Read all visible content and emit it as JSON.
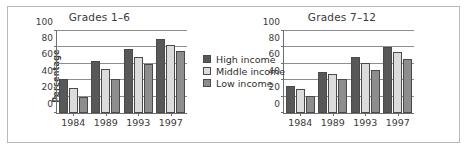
{
  "chart_data": [
    {
      "type": "bar",
      "title": "Grades 1–6",
      "xlabel": "",
      "ylabel": "Percentage",
      "categories": [
        "1984",
        "1989",
        "1993",
        "1997"
      ],
      "ylim": [
        0,
        100
      ],
      "yticks": [
        0,
        20,
        40,
        60,
        80,
        100
      ],
      "grid": true,
      "legend_position": "center-right",
      "series": [
        {
          "name": "High income",
          "values": [
            42,
            64,
            78,
            90
          ]
        },
        {
          "name": "Middle income",
          "values": [
            30,
            54,
            68,
            83
          ]
        },
        {
          "name": "Low income",
          "values": [
            19,
            41,
            60,
            76
          ]
        }
      ]
    },
    {
      "type": "bar",
      "title": "Grades 7–12",
      "xlabel": "",
      "ylabel": "",
      "categories": [
        "1984",
        "1989",
        "1993",
        "1997"
      ],
      "ylim": [
        0,
        100
      ],
      "yticks": [
        0,
        20,
        40,
        60,
        80,
        100
      ],
      "grid": true,
      "legend_position": "none",
      "series": [
        {
          "name": "High income",
          "values": [
            33,
            50,
            68,
            80
          ]
        },
        {
          "name": "Middle income",
          "values": [
            29,
            47,
            61,
            75
          ]
        },
        {
          "name": "Low income",
          "values": [
            21,
            42,
            53,
            66
          ]
        }
      ]
    }
  ],
  "legend": {
    "items": [
      {
        "label": "High income"
      },
      {
        "label": "Middle income"
      },
      {
        "label": "Low income"
      }
    ]
  },
  "colors": {
    "high_income": "#585858",
    "middle_income": "#dcdcdc",
    "low_income": "#8d8d8d",
    "axis": "#6f6f6f",
    "gridline": "#8e8e8e",
    "text": "#3a3a3a",
    "border": "#b9b9b9",
    "background": "#ffffff"
  }
}
